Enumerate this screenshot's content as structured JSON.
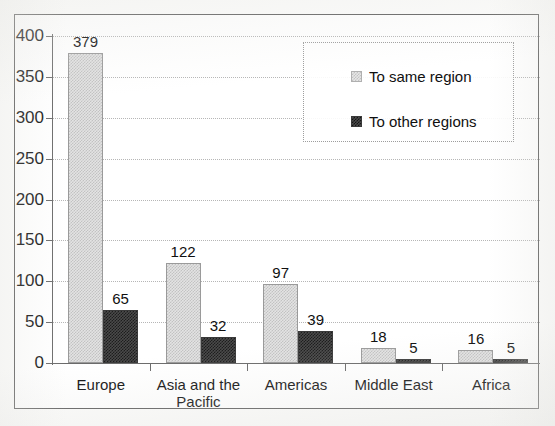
{
  "chart_data": {
    "type": "bar",
    "title": "",
    "subtitle": "",
    "xlabel": "",
    "ylabel": "",
    "categories": [
      "Europe",
      "Asia and the\nPacific",
      "Americas",
      "Middle East",
      "Africa"
    ],
    "series": [
      {
        "name": "To same region",
        "values": [
          379,
          122,
          97,
          18,
          16
        ],
        "swatch": "light",
        "color": "#d8d8d8"
      },
      {
        "name": "To other regions",
        "values": [
          65,
          32,
          39,
          5,
          5
        ],
        "swatch": "dark",
        "color": "#585858"
      }
    ],
    "ylim": [
      0,
      400
    ],
    "yticks": [
      0,
      50,
      100,
      150,
      200,
      250,
      300,
      350,
      400
    ],
    "ytick_labels": [
      "0",
      "50",
      "100",
      "150",
      "200",
      "250",
      "300",
      "350",
      "400"
    ],
    "grid": true,
    "grid_axis": "y",
    "legend_position": "top-right",
    "data_labels": true
  },
  "legend": {
    "entries": [
      {
        "label": "To same region"
      },
      {
        "label": "To other regions"
      }
    ]
  },
  "axis": {
    "tick_labels": [
      "400",
      "350",
      "300",
      "250",
      "200",
      "150",
      "100",
      "50",
      "0"
    ]
  },
  "bar_labels": {
    "europe_same": "379",
    "europe_other": "65",
    "asia_same": "122",
    "asia_other": "32",
    "americas_same": "97",
    "americas_other": "39",
    "middleeast_same": "18",
    "middleeast_other": "5",
    "africa_same": "16",
    "africa_other": "5"
  },
  "categories": {
    "europe": "Europe",
    "asia": "Asia and the\nPacific",
    "americas": "Americas",
    "middleeast": "Middle East",
    "africa": "Africa"
  }
}
